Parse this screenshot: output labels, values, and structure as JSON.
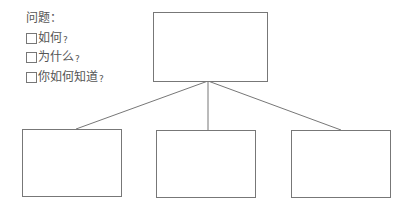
{
  "questions": {
    "title": "问题：",
    "items": [
      {
        "label": "如何",
        "mark": "?"
      },
      {
        "label": "为什么",
        "mark": "?"
      },
      {
        "label": "你如何知道",
        "mark": "?"
      }
    ]
  },
  "diagram": {
    "root_box": {
      "label": ""
    },
    "child_boxes": [
      {
        "label": ""
      },
      {
        "label": ""
      },
      {
        "label": ""
      }
    ]
  }
}
